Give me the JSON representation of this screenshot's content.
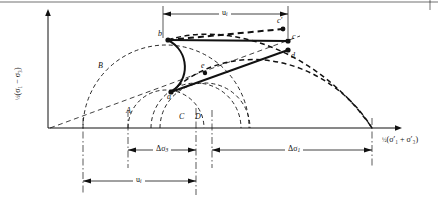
{
  "figure": {
    "type": "mohr-circle-stress-path-diagram",
    "background": "#ffffff",
    "line_color": "#111111",
    "width": 438,
    "height": 203
  },
  "axes": {
    "y_label_text": "(σ₁ − σ₃)",
    "y_label_fraction": "½",
    "x_label_text": "(σ′₁ + σ′₃)",
    "x_label_fraction": "½",
    "origin_x": 48,
    "origin_y": 128
  },
  "points": [
    {
      "id": "a",
      "label": "a",
      "x": 171,
      "y": 92
    },
    {
      "id": "b",
      "label": "b",
      "x": 168,
      "y": 40
    },
    {
      "id": "c",
      "label": "c",
      "x": 288,
      "y": 41
    },
    {
      "id": "cp",
      "label": "c′",
      "x": 283,
      "y": 29
    },
    {
      "id": "d",
      "label": "d",
      "x": 288,
      "y": 50
    },
    {
      "id": "e",
      "label": "e",
      "x": 205,
      "y": 73
    }
  ],
  "circles": [
    {
      "id": "A",
      "label": "A",
      "center_x": 166,
      "radius": 38
    },
    {
      "id": "B",
      "label": "B",
      "center_x": 166,
      "radius": 83
    },
    {
      "id": "C",
      "label": "C",
      "center_x": 196,
      "radius": 45
    },
    {
      "id": "D",
      "label": "D",
      "center_x": 205,
      "radius": 45
    }
  ],
  "dimensions": {
    "top": {
      "label": "u",
      "subscript": "i",
      "from_x": 163,
      "to_x": 288,
      "y": 14
    },
    "delta_sigma3": {
      "label": "Δσ",
      "subscript": "3",
      "from_x": 128,
      "to_x": 196,
      "y": 150
    },
    "delta_sigma1": {
      "label": "Δσ",
      "subscript": "1",
      "from_x": 212,
      "to_x": 372,
      "y": 150
    },
    "bottom_u": {
      "label": "u",
      "subscript": "i",
      "from_x": 83,
      "to_x": 196,
      "y": 181
    }
  },
  "curve_labels": [
    {
      "label": "B",
      "x": 100,
      "y": 66
    },
    {
      "label": "A",
      "x": 128,
      "y": 111
    },
    {
      "label": "C",
      "x": 181,
      "y": 117
    },
    {
      "label": "D",
      "x": 197,
      "y": 117
    }
  ]
}
